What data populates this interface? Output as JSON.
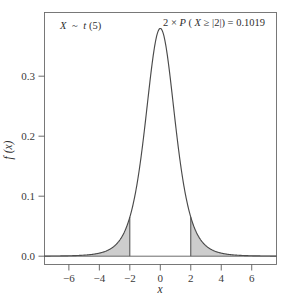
{
  "chart_data": {
    "type": "line",
    "title": "",
    "subtitle": "",
    "xlabel": "x",
    "ylabel": "f (x)",
    "xlim": [
      -7.6,
      7.6
    ],
    "ylim": [
      -0.012,
      0.395
    ],
    "grid": false,
    "legend": "none",
    "distribution": {
      "family": "Student t",
      "df": 5,
      "peak_density": 0.3796,
      "peak_x": 0
    },
    "xticks": [
      -6,
      -4,
      -2,
      0,
      2,
      4,
      6
    ],
    "xtick_labels": [
      "-6",
      "-4",
      "-2",
      "0",
      "2",
      "4",
      "6"
    ],
    "yticks": [
      0.0,
      0.1,
      0.2,
      0.3
    ],
    "ytick_labels": [
      "0.0",
      "0.1",
      "0.2",
      "0.3"
    ],
    "series": [
      {
        "name": "t(5) density",
        "x": [
          -7.6,
          -7.2,
          -6.8,
          -6.4,
          -6.0,
          -5.6,
          -5.2,
          -4.8,
          -4.4,
          -4.0,
          -3.6,
          -3.2,
          -2.8,
          -2.4,
          -2.0,
          -1.6,
          -1.2,
          -0.8,
          -0.4,
          0.0,
          0.4,
          0.8,
          1.2,
          1.6,
          2.0,
          2.4,
          2.8,
          3.2,
          3.6,
          4.0,
          4.4,
          4.8,
          5.2,
          5.6,
          6.0,
          6.4,
          6.8,
          7.2,
          7.6
        ],
        "values": [
          0.0011,
          0.0014,
          0.0017,
          0.0022,
          0.0029,
          0.0038,
          0.0051,
          0.0069,
          0.0096,
          0.0135,
          0.0195,
          0.0287,
          0.0432,
          0.0663,
          0.1,
          0.1497,
          0.2103,
          0.2802,
          0.3426,
          0.3796,
          0.3426,
          0.2802,
          0.2103,
          0.1497,
          0.1,
          0.0663,
          0.0432,
          0.0287,
          0.0195,
          0.0135,
          0.0096,
          0.0069,
          0.0051,
          0.0038,
          0.0029,
          0.0022,
          0.0017,
          0.0014,
          0.0011
        ]
      }
    ],
    "shaded_regions": [
      {
        "name": "left-tail",
        "from": -7.6,
        "to": -2.0,
        "color": "#c9c9c9"
      },
      {
        "name": "right-tail",
        "from": 2.0,
        "to": 7.6,
        "color": "#c9c9c9"
      }
    ],
    "annotations": [
      {
        "name": "distribution-label",
        "text": "X ~ t(5)",
        "x": -6.1,
        "y": 0.368
      },
      {
        "name": "probability-label",
        "text": "2 × P (X ≥ |2|) = 0.1019",
        "x": 0.1,
        "y": 0.381
      }
    ]
  },
  "labels": {
    "distribution_var": "X",
    "distribution_tilde": "~",
    "distribution_family": "t",
    "distribution_df": "(5)",
    "prob_prefix": "2 × ",
    "prob_p": "P",
    "prob_body": " (",
    "prob_var": "X",
    "prob_rel": " ≥ |2|) = ",
    "prob_value": "0.1019",
    "x_axis_title": "x",
    "y_axis_title": "f (x)"
  },
  "colors": {
    "curve": "#4a4a4a",
    "shade": "#c9c9c9",
    "frame": "#6b6b6b",
    "text": "#2f2f2f",
    "background": "#ffffff"
  }
}
